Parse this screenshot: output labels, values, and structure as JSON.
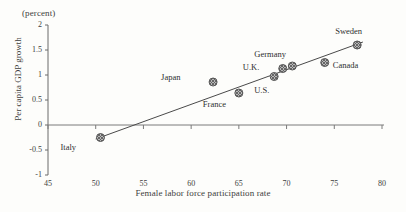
{
  "chart_data": {
    "type": "scatter",
    "title": "",
    "unit_note": "(percent)",
    "xlabel": "Female labor force participation rate",
    "ylabel": "Per capita GDP growth",
    "xlim": [
      45,
      80
    ],
    "ylim": [
      -1,
      2
    ],
    "xticks": [
      45,
      50,
      55,
      60,
      65,
      70,
      75,
      80
    ],
    "yticks": [
      -1,
      -0.5,
      0,
      0.5,
      1,
      1.5,
      2
    ],
    "xtick_labels": [
      "45",
      "50",
      "55",
      "60",
      "65",
      "70",
      "75",
      "80"
    ],
    "ytick_labels": [
      "-1",
      "-0.5",
      "0",
      "0.5",
      "1",
      "1.5",
      "2"
    ],
    "grid": false,
    "legend": "none",
    "zero_line": true,
    "trend_line": {
      "x0": 50.0,
      "y0": -0.28,
      "x1": 78.0,
      "y1": 1.66
    },
    "points": [
      {
        "name": "Italy",
        "x": 50.5,
        "y": -0.25,
        "label_dx": -26,
        "label_dy": 10
      },
      {
        "name": "Japan",
        "x": 62.3,
        "y": 0.86,
        "label_dx": -38,
        "label_dy": -4
      },
      {
        "name": "France",
        "x": 65.0,
        "y": 0.64,
        "label_dx": -22,
        "label_dy": 12
      },
      {
        "name": "U.S.",
        "x": 68.7,
        "y": 0.97,
        "label_dx": -6,
        "label_dy": 14
      },
      {
        "name": "U.K.",
        "x": 69.6,
        "y": 1.13,
        "label_dx": -26,
        "label_dy": -1
      },
      {
        "name": "Germany",
        "x": 70.6,
        "y": 1.18,
        "label_dx": -24,
        "label_dy": -11
      },
      {
        "name": "Canada",
        "x": 74.0,
        "y": 1.25,
        "label_dx": 8,
        "label_dy": 3
      },
      {
        "name": "Sweden",
        "x": 77.4,
        "y": 1.6,
        "label_dx": -8,
        "label_dy": -13
      }
    ]
  }
}
